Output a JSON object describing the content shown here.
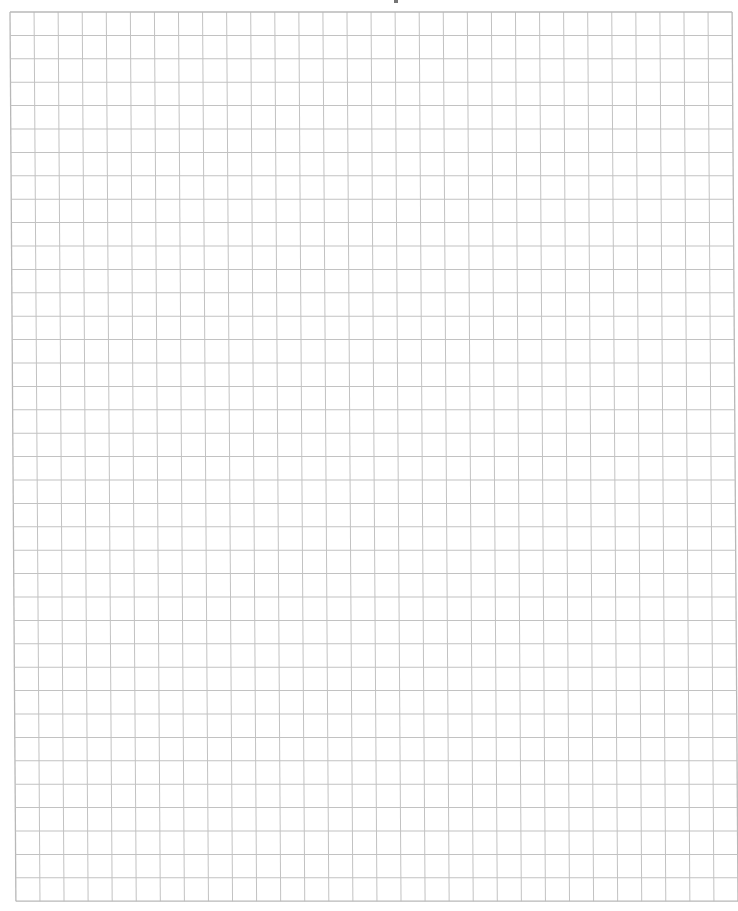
{
  "page": {
    "type": "graph-paper",
    "background_color": "#ffffff",
    "line_color": "#c2c2c2",
    "border_color": "#b8b8b8"
  },
  "grid": {
    "columns": 30,
    "rows": 38,
    "cell_width_px": 24.07,
    "cell_height_px": 23.4
  },
  "artifacts": {
    "top_mark_color": "#3a3a3a"
  }
}
